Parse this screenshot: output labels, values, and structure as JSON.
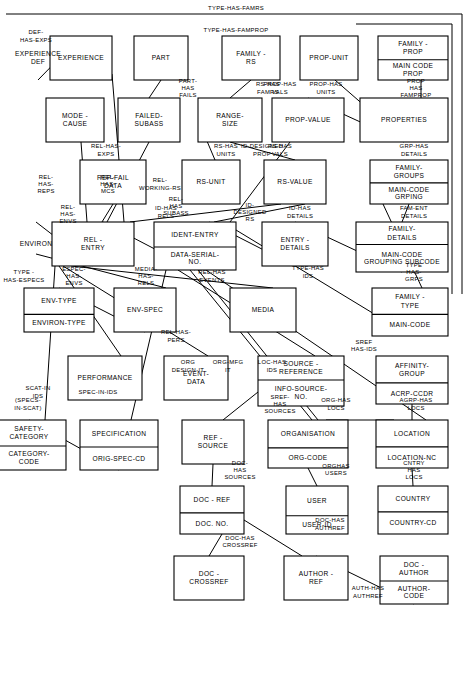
{
  "diagram": {
    "title": "",
    "type": "entity-relationship-diagram",
    "rotation_degrees": 90,
    "colors": {
      "line": "#000000",
      "box_fill": "#ffffff",
      "background": "#ffffff"
    },
    "entities": [
      {
        "id": "family_prop",
        "name": "FAMILY -\nPROP",
        "attrs": [
          "MAIN CODE\nPROP"
        ]
      },
      {
        "id": "properties",
        "name": "PROPERTIES",
        "attrs": []
      },
      {
        "id": "prop_unit",
        "name": "PROP-UNIT",
        "attrs": []
      },
      {
        "id": "prop_value",
        "name": "PROP-VALUE",
        "attrs": []
      },
      {
        "id": "family_groups",
        "name": "FAMILY-\nGROUPS",
        "attrs": [
          "MAIN-CODE\nGRPING"
        ]
      },
      {
        "id": "family_details",
        "name": "FAMILY-\nDETAILS",
        "attrs": [
          "MAIN-CODE\nGROUPING SUBCODE"
        ]
      },
      {
        "id": "entry_details",
        "name": "ENTRY -\nDETAILS",
        "attrs": []
      },
      {
        "id": "family_type",
        "name": "FAMILY -\nTYPE",
        "attrs": [
          "MAIN-CODE"
        ]
      },
      {
        "id": "family_rs",
        "name": "FAMILY -\nRS",
        "attrs": []
      },
      {
        "id": "range_size",
        "name": "RANGE-\nSIZE",
        "attrs": []
      },
      {
        "id": "rs_unit",
        "name": "RS-UNIT",
        "attrs": []
      },
      {
        "id": "rs_value",
        "name": "RS-VALUE",
        "attrs": []
      },
      {
        "id": "ident_entry",
        "name": "IDENT-ENTRY",
        "attrs": [
          "DATA-SERIAL-\nNO."
        ]
      },
      {
        "id": "part",
        "name": "PART",
        "attrs": []
      },
      {
        "id": "failed_subass",
        "name": "FAILED-\nSUBASS",
        "attrs": []
      },
      {
        "id": "rel_entry",
        "name": "REL -\nENTRY",
        "attrs": []
      },
      {
        "id": "experience",
        "name": "EXPERIENCE",
        "attrs": []
      },
      {
        "id": "experience_def",
        "name": "EXPERIENCE\nDEF",
        "attrs": []
      },
      {
        "id": "mode_cause",
        "name": "MODE -\nCAUSE",
        "attrs": []
      },
      {
        "id": "rep_fail_data",
        "name": "REP-FAIL\nDATA",
        "attrs": []
      },
      {
        "id": "environ",
        "name": "ENVIRON",
        "attrs": []
      },
      {
        "id": "env_spec",
        "name": "ENV-SPEC",
        "attrs": []
      },
      {
        "id": "env_type",
        "name": "ENV-TYPE",
        "attrs": [
          "ENVIRON-TYPE"
        ]
      },
      {
        "id": "media",
        "name": "MEDIA",
        "attrs": []
      },
      {
        "id": "event_data",
        "name": "EVENT-\nDATA",
        "attrs": []
      },
      {
        "id": "performance",
        "name": "PERFORMANCE",
        "attrs": []
      },
      {
        "id": "affinity_group",
        "name": "AFFINITY-\nGROUP",
        "attrs": [
          "ACRP-CCDR"
        ]
      },
      {
        "id": "location",
        "name": "LOCATION",
        "attrs": [
          "LOCATION-NC"
        ]
      },
      {
        "id": "country",
        "name": "COUNTRY",
        "attrs": [
          "COUNTRY-CD"
        ]
      },
      {
        "id": "organisation",
        "name": "ORGANISATION",
        "attrs": [
          "ORG-CODE"
        ]
      },
      {
        "id": "user",
        "name": "USER",
        "attrs": [
          "USER-ID"
        ]
      },
      {
        "id": "source_reference",
        "name": "SOURCE -\nREFERENCE",
        "attrs": [
          "INFO-SOURCE-\nNO."
        ]
      },
      {
        "id": "ref_source",
        "name": "REF -\nSOURCE",
        "attrs": []
      },
      {
        "id": "doc_ref",
        "name": "DOC - REF",
        "attrs": [
          "DOC. NO."
        ]
      },
      {
        "id": "doc_crossref",
        "name": "DOC -\nCROSSREF",
        "attrs": []
      },
      {
        "id": "doc_author",
        "name": "DOC -\nAUTHOR",
        "attrs": [
          "AUTHOR-\nCODE"
        ]
      },
      {
        "id": "author_ref",
        "name": "AUTHOR -\nREF",
        "attrs": []
      },
      {
        "id": "specification",
        "name": "SPECIFICATION",
        "attrs": [
          "ORIG-SPEC-CD"
        ]
      },
      {
        "id": "safety_category",
        "name": "SAFETY-\nCATEGORY",
        "attrs": [
          "CATEGORY-\nCODE"
        ]
      }
    ],
    "relationships": [
      {
        "id": "type_has_famrs",
        "label": "TYPE-HAS-FAMRS",
        "from": "family_type",
        "to": "family_rs"
      },
      {
        "id": "type_has_famprop",
        "label": "TYPE-HAS-FAMPROP",
        "from": "family_type",
        "to": "family_prop"
      },
      {
        "id": "prop_has_famprop",
        "label": "PROP\nHAS\nFAMPROP",
        "from": "properties",
        "to": "family_prop"
      },
      {
        "id": "prop_has_units",
        "label": "PROP-HAS\nUNITS",
        "from": "properties",
        "to": "prop_unit"
      },
      {
        "id": "prop_has_vals",
        "label": "PROP-HAS\nVALS",
        "from": "properties",
        "to": "prop_value"
      },
      {
        "id": "type_has_grps",
        "label": "TYPE\nHAS-\nGRPS",
        "from": "family_type",
        "to": "family_groups"
      },
      {
        "id": "grp_has_details",
        "label": "GRP-HAS\nDETAILS",
        "from": "family_groups",
        "to": "family_details"
      },
      {
        "id": "fam_ent_details",
        "label": "FAM-ENT\nDETAILS",
        "from": "family_details",
        "to": "entry_details"
      },
      {
        "id": "type_has_ids",
        "label": "TYPE-HAS\nIDS",
        "from": "family_type",
        "to": "ident_entry"
      },
      {
        "id": "id_designed_prop",
        "label": "ID-DESIGNED\nPROP",
        "from": "prop_value",
        "to": "ident_entry"
      },
      {
        "id": "id_has_details",
        "label": "ID-HAS\nDETAILS",
        "from": "entry_details",
        "to": "ident_entry"
      },
      {
        "id": "rs_has_famrs",
        "label": "RS-HAS\nFAMRS",
        "from": "family_rs",
        "to": "range_size"
      },
      {
        "id": "rs_has_units",
        "label": "RS-HAS\nUNITS",
        "from": "range_size",
        "to": "rs_unit"
      },
      {
        "id": "rs_has_vals",
        "label": "RS-HAS\nVALS",
        "from": "range_size",
        "to": "rs_value"
      },
      {
        "id": "id_designed_rs",
        "label": "ID-\nDESIGNED\nRS",
        "from": "rs_value",
        "to": "ident_entry"
      },
      {
        "id": "id_has_rels",
        "label": "ID-HAS\nRELS",
        "from": "ident_entry",
        "to": "rel_entry"
      },
      {
        "id": "rel_working_rs",
        "label": "REL-\nWORKING-RS",
        "from": "rs_value",
        "to": "rel_entry"
      },
      {
        "id": "part_has_fails",
        "label": "PART-\nHAS\nFAILS",
        "from": "part",
        "to": "failed_subass"
      },
      {
        "id": "rel_has_subass",
        "label": "REL-\nHAS\nSUBASS",
        "from": "failed_subass",
        "to": "rel_entry"
      },
      {
        "id": "rel_has_exps",
        "label": "REL-HAS-\nEXPS",
        "from": "rel_entry",
        "to": "experience"
      },
      {
        "id": "def_has_exps",
        "label": "DEF-\nHAS-EXPS",
        "from": "experience",
        "to": "experience_def"
      },
      {
        "id": "rel_has_mcs",
        "label": "REL-\nHAS-\nMCS",
        "from": "rel_entry",
        "to": "mode_cause"
      },
      {
        "id": "rel_has_reps",
        "label": "REL-\nHAS-\nREPS",
        "from": "rel_entry",
        "to": "rep_fail_data"
      },
      {
        "id": "rel_has_envs",
        "label": "REL-\nHAS-\nENVS",
        "from": "rel_entry",
        "to": "environ"
      },
      {
        "id": "espec_has_envs",
        "label": "ESPEC-\nHAS-\nENVS",
        "from": "environ",
        "to": "env_spec"
      },
      {
        "id": "type_has_especs",
        "label": "TYPE -\nHAS-ESPECS",
        "from": "env_spec",
        "to": "env_type"
      },
      {
        "id": "media_has_rels",
        "label": "MEDIA-\nHAS-\nRELS",
        "from": "rel_entry",
        "to": "media"
      },
      {
        "id": "rel_has_events",
        "label": "REL-HAS\nEVENTS",
        "from": "rel_entry",
        "to": "event_data"
      },
      {
        "id": "rel_has_pers",
        "label": "REL-HAS-\nPERS",
        "from": "rel_entry",
        "to": "performance"
      },
      {
        "id": "agrp_has_locs",
        "label": "AGRP-HAS\nLOCS",
        "from": "affinity_group",
        "to": "location"
      },
      {
        "id": "cntry_has_locs",
        "label": "CNTRY\nHAS\nLOCS",
        "from": "country",
        "to": "location"
      },
      {
        "id": "org_has_locs",
        "label": "ORG-HAS\nLOCS",
        "from": "location",
        "to": "organisation"
      },
      {
        "id": "loc_has_ids",
        "label": "LOC-HAS\nIDS",
        "from": "location",
        "to": "ident_entry"
      },
      {
        "id": "org_mfg_it",
        "label": "ORG-MFG\nIT",
        "from": "organisation",
        "to": "ident_entry"
      },
      {
        "id": "org_design_it",
        "label": "ORG\nDESIGN-IT",
        "from": "organisation",
        "to": "ident_entry"
      },
      {
        "id": "org_has_users",
        "label": "ORGHAS\nUSERS",
        "from": "organisation",
        "to": "user"
      },
      {
        "id": "sref_has_ids",
        "label": "SREF\nHAS-IDS",
        "from": "source_reference",
        "to": "ident_entry"
      },
      {
        "id": "sref_has_sources",
        "label": "SREF-\nHAS\nSOURCES",
        "from": "source_reference",
        "to": "ref_source"
      },
      {
        "id": "doc_has_sources",
        "label": "DOC-\nHAS\nSOURCES",
        "from": "doc_ref",
        "to": "ref_source"
      },
      {
        "id": "doc_has_crossref",
        "label": "DOC-HAS\nCROSSREF",
        "from": "doc_ref",
        "to": "doc_crossref"
      },
      {
        "id": "doc_has_authref",
        "label": "DOC-HAS\nAUTHREF",
        "from": "doc_ref",
        "to": "author_ref"
      },
      {
        "id": "auth_has_authref",
        "label": "AUTH-HAS\nAUTHREF",
        "from": "doc_author",
        "to": "author_ref"
      },
      {
        "id": "spec_in_ids",
        "label": "SPEC-IN-IDS",
        "from": "specification",
        "to": "ident_entry"
      },
      {
        "id": "specs_in_scat",
        "label": "(SPECS-\nIN-SCAT)",
        "from": "specification",
        "to": "safety_category"
      },
      {
        "id": "scat_in_ids",
        "label": "SCAT-IN\nIDS",
        "from": "safety_category",
        "to": "ident_entry"
      }
    ]
  }
}
